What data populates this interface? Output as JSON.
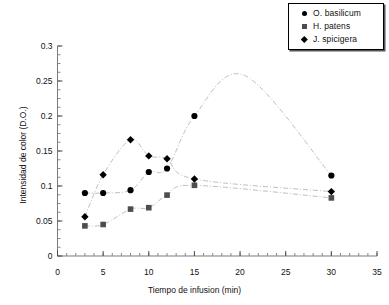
{
  "chart_data": {
    "type": "scatter",
    "title": "",
    "xlabel": "Tiempo de infusion (min)",
    "ylabel": "Intensidad de color (D.O.)",
    "xlim": [
      0,
      35
    ],
    "ylim": [
      0,
      0.3
    ],
    "xticks": [
      0,
      5,
      10,
      15,
      20,
      25,
      30,
      35
    ],
    "xtick_labels": [
      "0",
      "5",
      "10",
      "15",
      "20",
      "25",
      "30",
      "35"
    ],
    "yticks": [
      0,
      0.05,
      0.1,
      0.15,
      0.2,
      0.25,
      0.3
    ],
    "ytick_labels": [
      "0",
      "0.05",
      "0.1",
      "0.15",
      "0.2",
      "0.25",
      "0.3"
    ],
    "minor_xtick_interval": 1,
    "minor_ytick_interval": 0.0125,
    "grid": false,
    "legend_position": "top-right",
    "line_style": "dash-dot smoothed",
    "line_color": "#bfbfbf",
    "x": [
      3,
      5,
      8,
      10,
      12,
      15,
      30
    ],
    "series": [
      {
        "name": "O. basilicum",
        "marker": "circle",
        "color": "#000000",
        "x": [
          3,
          5,
          8,
          10,
          12,
          15,
          30
        ],
        "values": [
          0.09,
          0.09,
          0.094,
          0.12,
          0.125,
          0.2,
          0.115
        ],
        "curve_peak": {
          "x": 20.5,
          "y": 0.258
        }
      },
      {
        "name": "H. patens",
        "marker": "square",
        "color": "#4d4d4d",
        "x": [
          3,
          5,
          8,
          10,
          12,
          15,
          30
        ],
        "values": [
          0.043,
          0.045,
          0.067,
          0.069,
          0.087,
          0.101,
          0.083
        ]
      },
      {
        "name": "J. spicigera",
        "marker": "diamond",
        "color": "#000000",
        "x": [
          3,
          5,
          8,
          10,
          12,
          15,
          30
        ],
        "values": [
          0.056,
          0.116,
          0.166,
          0.143,
          0.139,
          0.11,
          0.092
        ]
      }
    ]
  },
  "legend": {
    "entries": [
      {
        "label": "O. basilicum",
        "marker": "circle"
      },
      {
        "label": "H. patens",
        "marker": "square"
      },
      {
        "label": "J. spicigera",
        "marker": "diamond"
      }
    ]
  }
}
